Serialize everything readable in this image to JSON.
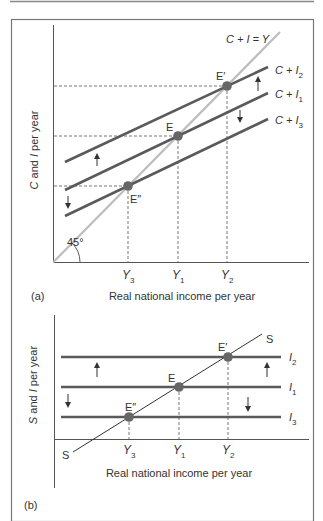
{
  "colors": {
    "frame": "#777777",
    "axis": "#555555",
    "curve": "#5a5a5a",
    "guide_45": "#bdbdbd",
    "point": "#666666",
    "dashed": "#555555",
    "text": "#333333"
  },
  "panel_a": {
    "tag": "(a)",
    "y_label_var": "C",
    "y_label_rest": " and ",
    "y_label_var2": "I",
    "y_label_tail": " per year",
    "x_label": "Real national income per year",
    "angle_label": "45°",
    "guide_label": "C + I = Y",
    "curves": [
      {
        "name": "C + I",
        "sub": "2",
        "label": "C + I"
      },
      {
        "name": "C + I",
        "sub": "1",
        "label": "C + I"
      },
      {
        "name": "C + I",
        "sub": "3",
        "label": "C + I"
      }
    ],
    "points": {
      "e_prime": "E′",
      "e": "E",
      "e_double": "E″"
    },
    "ticks": [
      {
        "label": "Y",
        "sub": "3"
      },
      {
        "label": "Y",
        "sub": "1"
      },
      {
        "label": "Y",
        "sub": "2"
      }
    ]
  },
  "panel_b": {
    "tag": "(b)",
    "y_label_var": "S",
    "y_label_rest": " and ",
    "y_label_var2": "I",
    "y_label_tail": " per year",
    "x_label": "Real national income per year",
    "saving_label_top": "S",
    "saving_label_bottom": "S",
    "lines": [
      {
        "label": "I",
        "sub": "2"
      },
      {
        "label": "I",
        "sub": "1"
      },
      {
        "label": "I",
        "sub": "3"
      }
    ],
    "points": {
      "e_prime": "E′",
      "e": "E",
      "e_double": "E″"
    },
    "ticks": [
      {
        "label": "Y",
        "sub": "3"
      },
      {
        "label": "Y",
        "sub": "1"
      },
      {
        "label": "Y",
        "sub": "2"
      }
    ]
  }
}
